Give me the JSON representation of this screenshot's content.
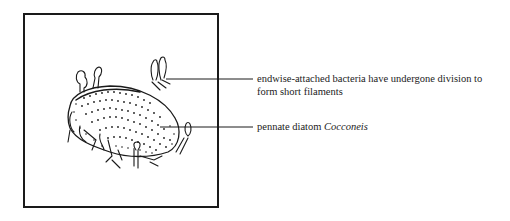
{
  "figure": {
    "labels": [
      {
        "id": "bacteria",
        "line1": "endwise-attached bacteria have undergone division to",
        "line2": "form short filaments"
      },
      {
        "id": "diatom",
        "text": "pennate diatom ",
        "italic": "Cocconeis"
      }
    ]
  },
  "colors": {
    "ink": "#1a1a1a",
    "background": "#ffffff"
  }
}
